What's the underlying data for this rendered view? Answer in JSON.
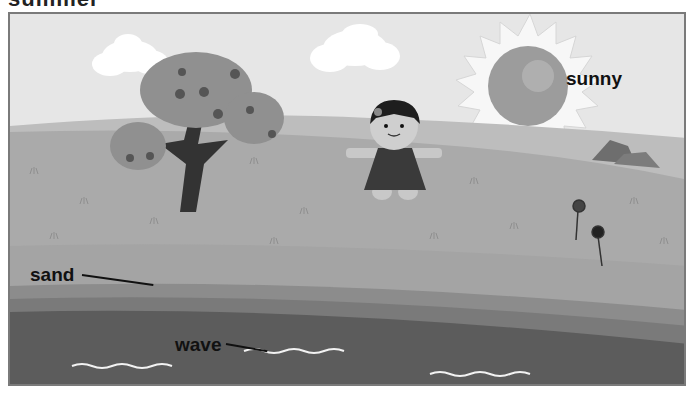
{
  "page": {
    "title_partial": "summer"
  },
  "scene": {
    "labels": {
      "weather": "sunny",
      "sand": "sand",
      "wave": "wave"
    },
    "elements": [
      "cloud",
      "cloud",
      "tree",
      "girl",
      "sun",
      "rocks",
      "flowers",
      "grass-hill",
      "sand",
      "sea"
    ],
    "colors": {
      "sky": "#e6e6e6",
      "hill_back": "#bdbdbd",
      "hill_front": "#aaaaaa",
      "sand": "#a4a4a4",
      "shore_band_1": "#8c8c8c",
      "shore_band_2": "#7a7a7a",
      "sea": "#5c5c5c",
      "frame": "#7a7a7a"
    }
  }
}
